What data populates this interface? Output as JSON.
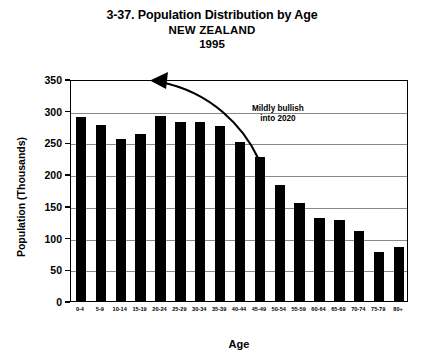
{
  "chart_data": {
    "type": "bar",
    "title": "3-37. Population Distribution by Age",
    "subtitle": "NEW ZEALAND",
    "year_label": "1995",
    "xlabel": "Age",
    "ylabel": "Population (Thousands)",
    "ylim": [
      0,
      350
    ],
    "ytick_step": 50,
    "yticks": [
      350,
      300,
      250,
      200,
      150,
      100,
      50,
      0
    ],
    "ytick_labels": [
      "350",
      "300",
      "250",
      "200",
      "150",
      "100",
      "50",
      "0"
    ],
    "grid": "horizontal",
    "legend": "none",
    "bar_color": "#000000",
    "categories": [
      "0-4",
      "5-9",
      "10-14",
      "15-19",
      "20-24",
      "25-29",
      "30-34",
      "35-39",
      "40-44",
      "45-49",
      "50-54",
      "55-59",
      "60-64",
      "65-69",
      "70-74",
      "75-79",
      "80+"
    ],
    "values": [
      290,
      278,
      256,
      264,
      292,
      283,
      282,
      276,
      250,
      227,
      183,
      155,
      131,
      128,
      110,
      78,
      85
    ],
    "annotations": [
      {
        "text_line_1": "Mildly bullish",
        "text_line_2": "into 2020",
        "arrow": "curved-arrow-pointing-left"
      }
    ]
  }
}
